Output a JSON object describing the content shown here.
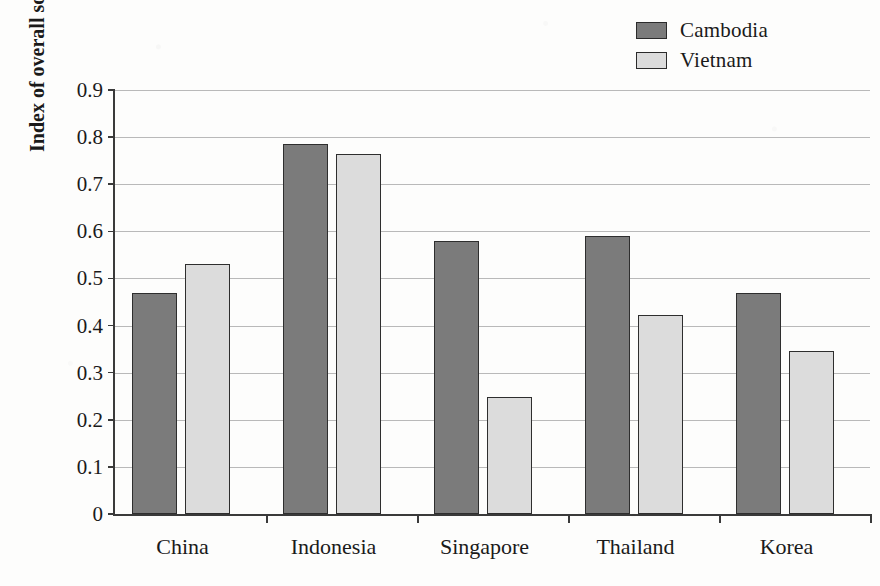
{
  "chart_data": {
    "type": "bar",
    "title": "",
    "xlabel": "",
    "ylabel": "Index of overall source taxing rights",
    "categories": [
      "China",
      "Indonesia",
      "Singapore",
      "Thailand",
      "Korea"
    ],
    "series": [
      {
        "name": "Cambodia",
        "color": "#7b7b7b",
        "values": [
          0.47,
          0.785,
          0.58,
          0.59,
          0.47
        ]
      },
      {
        "name": "Vietnam",
        "color": "#dcdcdc",
        "values": [
          0.53,
          0.765,
          0.248,
          0.423,
          0.346
        ]
      }
    ],
    "ylim": [
      0,
      0.9
    ],
    "ytick_labels": [
      "0",
      "0.1",
      "0.2",
      "0.3",
      "0.4",
      "0.5",
      "0.6",
      "0.7",
      "0.8",
      "0.9"
    ],
    "ytick_values": [
      0,
      0.1,
      0.2,
      0.3,
      0.4,
      0.5,
      0.6,
      0.7,
      0.8,
      0.9
    ],
    "grid": true,
    "legend_position": "top-right",
    "legend": [
      "Cambodia",
      "Vietnam"
    ]
  },
  "legend": {
    "entries": [
      {
        "label": "Cambodia",
        "color": "#7b7b7b"
      },
      {
        "label": "Vietnam",
        "color": "#dcdcdc"
      }
    ]
  },
  "axes": {
    "y_title": "Index of overall source taxing rights"
  },
  "colors": {
    "cambodia": "#7b7b7b",
    "vietnam": "#dcdcdc",
    "axis": "#3a3a3a",
    "gridline": "#b9b9b9",
    "background": "#fdfdfc"
  }
}
